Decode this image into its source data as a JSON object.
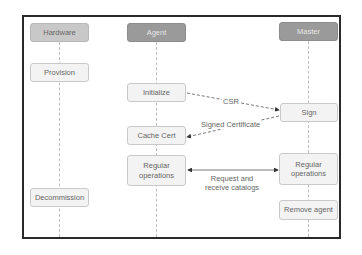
{
  "diagram": {
    "type": "sequence",
    "participants": [
      {
        "id": "hardware",
        "label": "Hardware"
      },
      {
        "id": "agent",
        "label": "Agent"
      },
      {
        "id": "master",
        "label": "Master"
      }
    ],
    "steps": {
      "provision": "Provision",
      "initialize": "Initialize",
      "sign": "Sign",
      "cache_cert": "Cache Cert",
      "agent_regular": "Regular operations",
      "master_regular": "Regular operations",
      "decommission": "Decommission",
      "remove_agent": "Remove agent"
    },
    "messages": {
      "csr": "CSR",
      "signed_certificate": "Signed Certificate",
      "catalogs_line1": "Request and",
      "catalogs_line2": "receive catalogs"
    },
    "colors": {
      "header_dark": "#9a9a9a",
      "header_light": "#c8c8c8",
      "box_fill": "#f3f3f3",
      "frame": "#2a2a2a"
    }
  }
}
